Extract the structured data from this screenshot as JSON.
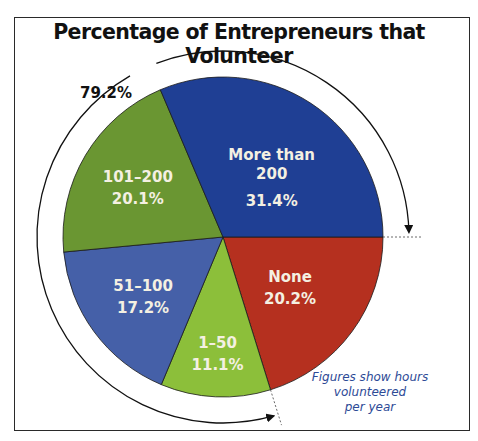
{
  "chart_data": {
    "type": "pie",
    "title": "Percentage of Entrepreneurs that Volunteer",
    "categories": [
      "None",
      "1–50",
      "51–100",
      "101–200",
      "More than 200"
    ],
    "values": [
      20.2,
      11.1,
      17.2,
      20.1,
      31.4
    ],
    "unit": "%",
    "colors": [
      "#b5301f",
      "#8cbf3a",
      "#4560a8",
      "#6a9632",
      "#1f3f94"
    ],
    "slice_labels": [
      {
        "name": "None",
        "value": "20.2%"
      },
      {
        "name": "1–50",
        "value": "11.1%"
      },
      {
        "name": "51–100",
        "value": "17.2%"
      },
      {
        "name": "101–200",
        "value": "20.1%"
      },
      {
        "name": [
          "More than",
          "200"
        ],
        "value": "31.4%"
      }
    ],
    "annotations": [
      {
        "text": "79.2%",
        "meaning": "Sum of all volunteering categories (1–50, 51–100, 101–200, More than 200), indicated by outer arc arrows"
      },
      {
        "text": "Figures show hours volunteered per year"
      }
    ],
    "start_angle_deg": 0,
    "direction": "clockwise",
    "legend": "none (labels inside slices)"
  },
  "title": "Percentage of Entrepreneurs that Volunteer",
  "total_label": "79.2%",
  "note": {
    "line1": "Figures show hours",
    "line2": "volunteered",
    "line3": "per year"
  }
}
